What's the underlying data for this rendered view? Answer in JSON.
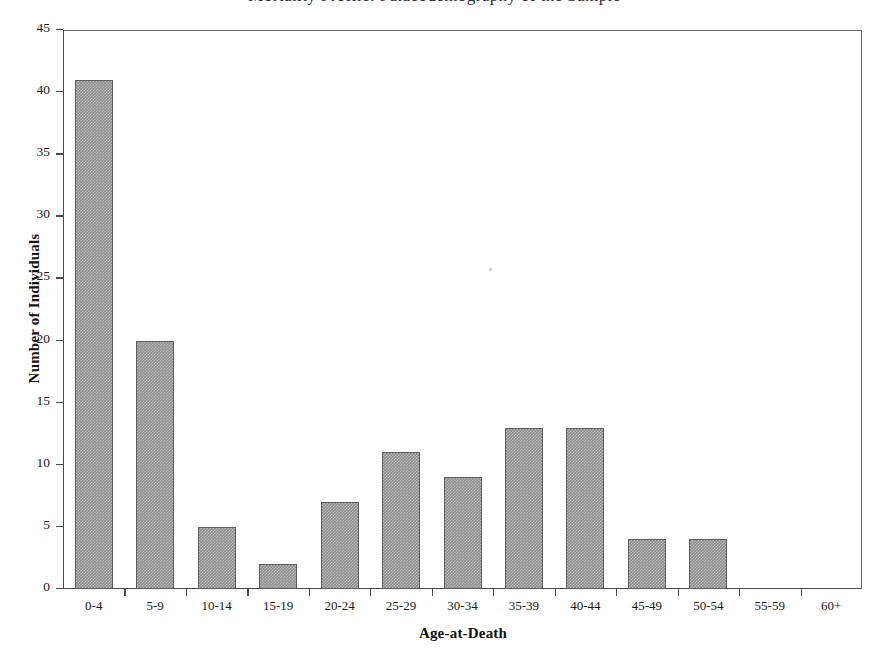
{
  "figure": {
    "title_cropped": "Mortality Profile: Palaeodemography of the Sample",
    "background_color": "#ffffff",
    "frame_color": "#4a4a4a",
    "bar_fill_color": "#8d8d8d",
    "bar_edge_color": "#5d5d5d"
  },
  "chart_data": {
    "type": "bar",
    "title": "",
    "xlabel": "Age-at-Death",
    "ylabel": "Number of Individuals",
    "categories": [
      "0-4",
      "5-9",
      "10-14",
      "15-19",
      "20-24",
      "25-29",
      "30-34",
      "35-39",
      "40-44",
      "45-49",
      "50-54",
      "55-59",
      "60+"
    ],
    "values": [
      41,
      20,
      5,
      2,
      7,
      11,
      9,
      13,
      13,
      4,
      4,
      0,
      0
    ],
    "ylim": [
      0,
      45
    ],
    "yticks": [
      0,
      5,
      10,
      15,
      20,
      25,
      30,
      35,
      40,
      45
    ],
    "ytick_labels": [
      "0",
      "5",
      "10",
      "15",
      "20",
      "25",
      "30",
      "35",
      "40",
      "45"
    ],
    "grid": false,
    "legend": null,
    "total_individuals": 129
  }
}
